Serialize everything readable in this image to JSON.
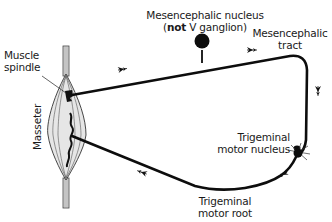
{
  "diagram": {
    "type": "neural pathway diagram",
    "labels": {
      "mesencephalic_nucleus_line1": "Mesencephalic nucleus",
      "mesencephalic_nucleus_line2_open": "(",
      "mesencephalic_nucleus_line2_bold": "not",
      "mesencephalic_nucleus_line2_rest": " V ganglion)",
      "mesencephalic_tract_line1": "Mesencephalic",
      "mesencephalic_tract_line2": "tract",
      "muscle_spindle_line1": "Muscle",
      "muscle_spindle_line2": "spindle",
      "masseter": "Masseter",
      "trigeminal_motor_nucleus_line1": "Trigeminal",
      "trigeminal_motor_nucleus_line2": "motor nucleus",
      "trigeminal_motor_root_line1": "Trigeminal",
      "trigeminal_motor_root_line2": "motor root"
    },
    "nodes": [
      {
        "id": "masseter",
        "kind": "muscle"
      },
      {
        "id": "muscle-spindle",
        "kind": "receptor"
      },
      {
        "id": "mesencephalic-nucleus",
        "kind": "cell-body"
      },
      {
        "id": "trigeminal-motor-nucleus",
        "kind": "cell-body"
      }
    ],
    "edges": [
      {
        "from": "muscle-spindle",
        "to": "mesencephalic-nucleus",
        "via": "afferent fiber"
      },
      {
        "from": "mesencephalic-nucleus",
        "to": "trigeminal-motor-nucleus",
        "via": "mesencephalic tract"
      },
      {
        "from": "trigeminal-motor-nucleus",
        "to": "masseter",
        "via": "trigeminal motor root"
      }
    ],
    "colors": {
      "line": "#0d0d0d",
      "muscle_fill": "#e4e4e4",
      "muscle_stroke": "#333333",
      "background": "#ffffff"
    }
  }
}
